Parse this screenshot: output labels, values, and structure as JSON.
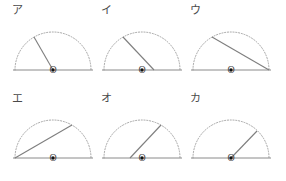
{
  "figure": {
    "colors": {
      "background": "#ffffff",
      "arc": "#9a9a9a",
      "baseline": "#8a8a8a",
      "segment": "#7e7e7e",
      "dot": "#111111",
      "text": "#4a4a4a"
    },
    "geometry": {
      "radius": 38,
      "center_x": 45,
      "center_y": 52,
      "arc_style": "dotted",
      "baseline_style": "solid"
    },
    "origin_label": "O"
  },
  "panels": [
    {
      "label": "ア",
      "name": "panel-a",
      "row": 0,
      "col": 0,
      "segment": {
        "kind": "radius",
        "from": {
          "x": 45,
          "y": 52
        },
        "to": {
          "x": 26,
          "y": 19
        },
        "angle_deg": 120
      }
    },
    {
      "label": "イ",
      "name": "panel-i",
      "row": 0,
      "col": 1,
      "segment": {
        "kind": "chord",
        "from": {
          "x": 57,
          "y": 52
        },
        "to": {
          "x": 26,
          "y": 19
        },
        "angle_deg": 133
      }
    },
    {
      "label": "ウ",
      "name": "panel-u",
      "row": 0,
      "col": 2,
      "segment": {
        "kind": "chord",
        "from": {
          "x": 83,
          "y": 52
        },
        "to": {
          "x": 26,
          "y": 19
        },
        "angle_deg": 150
      }
    },
    {
      "label": "エ",
      "name": "panel-e",
      "row": 1,
      "col": 0,
      "segment": {
        "kind": "chord",
        "from": {
          "x": 7,
          "y": 52
        },
        "to": {
          "x": 64,
          "y": 19
        },
        "angle_deg": 30
      }
    },
    {
      "label": "オ",
      "name": "panel-o",
      "row": 1,
      "col": 1,
      "segment": {
        "kind": "chord",
        "from": {
          "x": 33,
          "y": 52
        },
        "to": {
          "x": 64,
          "y": 19
        },
        "angle_deg": 47
      }
    },
    {
      "label": "カ",
      "name": "panel-ka",
      "row": 1,
      "col": 2,
      "segment": {
        "kind": "radius",
        "from": {
          "x": 45,
          "y": 52
        },
        "to": {
          "x": 71,
          "y": 25
        },
        "angle_deg": 46
      }
    }
  ]
}
